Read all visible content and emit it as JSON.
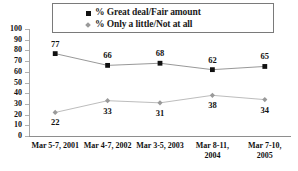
{
  "chart_data": {
    "type": "line",
    "title": "",
    "xlabel": "",
    "ylabel": "",
    "ylim": [
      0,
      100
    ],
    "yticks": [
      0,
      10,
      20,
      30,
      40,
      50,
      60,
      70,
      80,
      90,
      100
    ],
    "grid": false,
    "legend_position": "top-center",
    "categories": [
      "Mar 5-7, 2001",
      "Mar 4-7, 2002",
      "Mar 3-5, 2003",
      "Mar 8-11, 2004",
      "Mar 7-10, 2005"
    ],
    "series": [
      {
        "name": "% Great deal/Fair amount",
        "marker": "filled-square",
        "color": "#111111",
        "line_color": "#8c8c8c",
        "label_position": "above",
        "values": [
          77,
          66,
          68,
          62,
          65
        ]
      },
      {
        "name": "% Only a little/Not at all",
        "marker": "diamond",
        "color": "#9a9a9a",
        "line_color": "#b4b4b4",
        "label_position": "below",
        "values": [
          22,
          33,
          31,
          38,
          34
        ]
      }
    ]
  },
  "legend": {
    "items": [
      {
        "label": "% Great deal/Fair amount",
        "marker": "square-marker-icon"
      },
      {
        "label": "% Only a little/Not at all",
        "marker": "diamond-marker-icon"
      }
    ]
  },
  "axes": {
    "y_tick_labels": [
      "100",
      "90",
      "80",
      "70",
      "60",
      "50",
      "40",
      "30",
      "20",
      "10",
      "0"
    ],
    "x_tick_labels": [
      "Mar 5-7, 2001",
      "Mar 4-7, 2002",
      "Mar 3-5, 2003",
      "Mar 8-11,\n2004",
      "Mar 7-10,\n2005"
    ]
  },
  "x_label_lines": [
    [
      "Mar 5-7, 2001"
    ],
    [
      "Mar 4-7, 2002"
    ],
    [
      "Mar 3-5, 2003"
    ],
    [
      "Mar 8-11,",
      "2004"
    ],
    [
      "Mar 7-10,",
      "2005"
    ]
  ],
  "point_labels": {
    "series0": [
      "77",
      "66",
      "68",
      "62",
      "65"
    ],
    "series1": [
      "22",
      "33",
      "31",
      "38",
      "34"
    ]
  }
}
